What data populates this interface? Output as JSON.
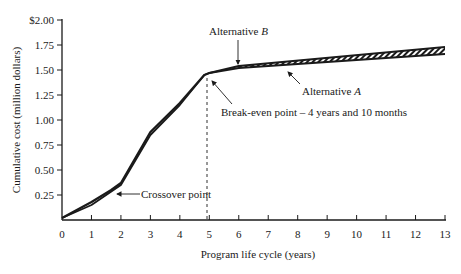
{
  "chart_data": {
    "type": "line",
    "title": "",
    "xlabel": "Program life cycle (years)",
    "ylabel": "Cumulative cost (million dollars)",
    "xlim": [
      0,
      13
    ],
    "ylim": [
      0,
      2.0
    ],
    "x_ticks": [
      "0",
      "1",
      "2",
      "3",
      "4",
      "5",
      "6",
      "7",
      "8",
      "9",
      "10",
      "11",
      "12",
      "13"
    ],
    "y_ticks": [
      "0.25",
      "0.50",
      "0.75",
      "1.00",
      "1.25",
      "1.50",
      "1.75",
      "$2.00"
    ],
    "y_tick_values": [
      0.25,
      0.5,
      0.75,
      1.0,
      1.25,
      1.5,
      1.75,
      2.0
    ],
    "grid": false,
    "legend": null,
    "series": [
      {
        "name": "Alternative A",
        "x": [
          0,
          1,
          2,
          3,
          4,
          4.83,
          5,
          6,
          13
        ],
        "values": [
          0.02,
          0.15,
          0.35,
          0.85,
          1.15,
          1.45,
          1.47,
          1.52,
          1.66
        ]
      },
      {
        "name": "Alternative B",
        "x": [
          0,
          1,
          1.67,
          2,
          3,
          4,
          4.83,
          5,
          6,
          13
        ],
        "values": [
          0.02,
          0.18,
          0.3,
          0.37,
          0.88,
          1.17,
          1.45,
          1.47,
          1.54,
          1.73
        ]
      }
    ],
    "annotations": [
      {
        "text": "Alternative B",
        "italic_part": "B",
        "x": 5.2,
        "y": 1.55,
        "arrow": true
      },
      {
        "text": "Alternative A",
        "italic_part": "A",
        "x": 8.0,
        "y": 1.55,
        "arrow": true
      },
      {
        "text": "Break-even point – 4 years and 10 months",
        "x": 4.83,
        "y": 1.45,
        "arrow": true
      },
      {
        "text": "Crossover point",
        "x": 1.67,
        "y": 0.3,
        "arrow": true
      }
    ],
    "reference_lines": [
      {
        "type": "vertical",
        "x": 4.83,
        "style": "dashed",
        "label": "break-even"
      }
    ]
  },
  "labels": {
    "alt_b_prefix": "Alternative ",
    "alt_b_letter": "B",
    "alt_a_prefix": "Alternative ",
    "alt_a_letter": "A",
    "break_even": "Break-even point – 4 years and 10 months",
    "crossover": "Crossover point"
  },
  "colors": {
    "ink": "#1a1a1a",
    "background": "#ffffff"
  }
}
